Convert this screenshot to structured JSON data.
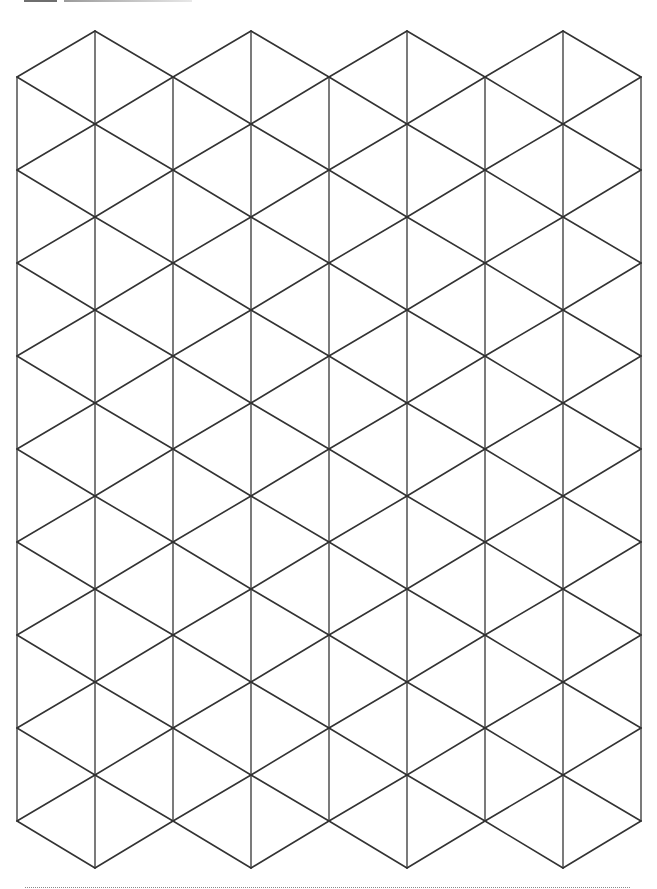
{
  "page": {
    "type": "isometric-triangle-grid-paper",
    "width": 657,
    "height": 889,
    "background": "#ffffff"
  },
  "header": {
    "bars": [
      {
        "name": "dark-bar",
        "x": 24,
        "width": 33,
        "color": "#6e6e6e"
      },
      {
        "name": "light-bar",
        "x": 64,
        "width": 128,
        "color": "#b0b0b0"
      }
    ]
  },
  "grid": {
    "line_color": "#333333",
    "diagonal_width": 1.6,
    "vertical_width": 1.3,
    "column_x": [
      17,
      95,
      173,
      251,
      329,
      407,
      485,
      563,
      641
    ],
    "even_column_y_start": 77,
    "odd_column_y_start": 31,
    "row_step": 93,
    "even_column_points": 9,
    "odd_column_points": 10,
    "triangle_side_approx": 92
  },
  "footer": {
    "rule_style": "dotted",
    "rule_color": "#8a8a8a",
    "x_start": 25,
    "x_end": 630,
    "y": 887
  }
}
